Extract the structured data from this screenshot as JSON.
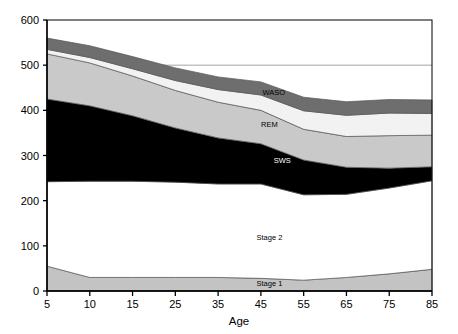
{
  "chart_data": {
    "type": "area",
    "title": "",
    "subtitle": "",
    "xlabel": "Age",
    "ylabel": "",
    "x": [
      5,
      10,
      15,
      25,
      35,
      45,
      55,
      65,
      75,
      85
    ],
    "xtick_labels": [
      "5",
      "10",
      "15",
      "25",
      "35",
      "45",
      "55",
      "65",
      "75",
      "85"
    ],
    "ytick_labels": [
      "0",
      "100",
      "200",
      "300",
      "400",
      "500",
      "600"
    ],
    "yticks": [
      0,
      100,
      200,
      300,
      400,
      500,
      600
    ],
    "xlim": [
      5,
      85
    ],
    "ylim": [
      0,
      600
    ],
    "grid": true,
    "gridlines_y": [
      500
    ],
    "legend": "inline-labels",
    "legend_position": "inline",
    "stacked": true,
    "stack_order_bottom_to_top": [
      "Stage 1",
      "Stage 2",
      "SWS",
      "REM",
      "WASO",
      "Sleep Latency"
    ],
    "series": [
      {
        "name": "Stage 1",
        "label": "Stage 1",
        "color": "#c3c3c3",
        "values": [
          55,
          30,
          30,
          30,
          30,
          28,
          24,
          30,
          38,
          48
        ]
      },
      {
        "name": "Stage 2",
        "label": "Stage 2",
        "color": "#ffffff",
        "values": [
          187,
          213,
          213,
          211,
          207,
          209,
          189,
          184,
          190,
          196
        ]
      },
      {
        "name": "SWS",
        "label": "SWS",
        "color": "#000000",
        "values": [
          183,
          167,
          145,
          120,
          102,
          89,
          77,
          60,
          44,
          31
        ]
      },
      {
        "name": "REM",
        "label": "REM",
        "color": "#c9c9c9",
        "values": [
          100,
          95,
          88,
          83,
          79,
          74,
          68,
          68,
          72,
          70
        ]
      },
      {
        "name": "WASO",
        "label": "WASO",
        "color": "#f2f2f2",
        "values": [
          10,
          12,
          16,
          22,
          28,
          34,
          41,
          47,
          50,
          48
        ]
      },
      {
        "name": "Sleep Latency",
        "label": "Sleep Latency",
        "color": "#6e6e6e",
        "values": [
          25,
          26,
          27,
          28,
          28,
          29,
          30,
          30,
          30,
          30
        ]
      }
    ],
    "totals": [
      560,
      543,
      519,
      494,
      474,
      463,
      429,
      419,
      424,
      423
    ],
    "colors": {
      "stage1": "#c3c3c3",
      "stage2": "#ffffff",
      "sws": "#000000",
      "rem": "#c9c9c9",
      "waso": "#f2f2f2",
      "sleep_latency": "#6e6e6e",
      "axis": "#000000",
      "gridline": "#9a9a9a",
      "plot_border": "#000000",
      "background": "#ffffff"
    },
    "label_positions": {
      "sleep_latency": {
        "x": 55,
        "y": 485
      },
      "waso": {
        "x": 48,
        "y": 440
      },
      "rem": {
        "x": 47,
        "y": 370
      },
      "sws": {
        "x": 50,
        "y": 290
      },
      "stage2": {
        "x": 47,
        "y": 120
      },
      "stage1": {
        "x": 47,
        "y": 18
      }
    }
  }
}
